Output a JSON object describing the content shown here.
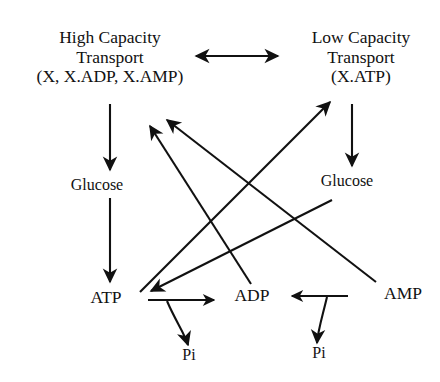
{
  "diagram": {
    "stroke_color": "#111111",
    "background_color": "#ffffff",
    "nodes": {
      "high_capacity": {
        "line1": "High Capacity",
        "line2": "Transport",
        "line3": "(X, X.ADP, X.AMP)"
      },
      "low_capacity": {
        "line1": "Low Capacity",
        "line2": "Transport",
        "line3": "(X.ATP)"
      },
      "glucose_left": "Glucose",
      "glucose_right": "Glucose",
      "atp": "ATP",
      "adp": "ADP",
      "amp": "AMP",
      "pi_left": "Pi",
      "pi_right": "Pi"
    },
    "edges": [
      {
        "id": "interconversion",
        "from": "High Capacity Transport (X, X.ADP, X.AMP)",
        "to": "Low Capacity Transport (X.ATP)",
        "arrowheads": "both",
        "style": "straight-horizontal"
      },
      {
        "id": "high-to-glucose",
        "from": "High Capacity Transport (X, X.ADP, X.AMP)",
        "to": "Glucose",
        "arrowheads": "end",
        "style": "straight-vertical"
      },
      {
        "id": "low-to-glucose",
        "from": "Low Capacity Transport (X.ATP)",
        "to": "Glucose",
        "arrowheads": "end",
        "style": "straight-vertical"
      },
      {
        "id": "glucose-left-to-atp",
        "from": "Glucose",
        "to": "ATP",
        "arrowheads": "end",
        "style": "straight-vertical"
      },
      {
        "id": "atp-to-low-capacity",
        "from": "ATP",
        "to": "Low Capacity Transport (X.ATP)",
        "arrowheads": "end",
        "style": "diagonal"
      },
      {
        "id": "adp-to-high-capacity",
        "from": "ADP",
        "to": "High Capacity Transport (X, X.ADP, X.AMP)",
        "arrowheads": "end",
        "style": "diagonal"
      },
      {
        "id": "amp-to-high-capacity",
        "from": "AMP",
        "to": "High Capacity Transport (X, X.ADP, X.AMP)",
        "arrowheads": "end",
        "style": "diagonal"
      },
      {
        "id": "glucose-right-to-atp",
        "from": "Glucose",
        "to": "ATP",
        "arrowheads": "end",
        "style": "diagonal"
      },
      {
        "id": "atp-to-adp-release-pi",
        "from": "ATP",
        "to": "ADP",
        "arrowheads": "end",
        "style": "hook-with-pi-branch",
        "branch_product": "Pi"
      },
      {
        "id": "adp-to-amp-release-pi",
        "from": "AMP",
        "to": "ADP",
        "arrowheads": "end",
        "style": "hook-with-pi-branch",
        "branch_product": "Pi"
      }
    ]
  }
}
